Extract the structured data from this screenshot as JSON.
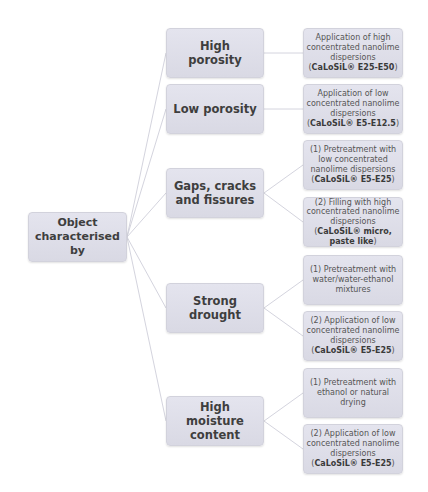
{
  "diagram": {
    "root": {
      "label_line1": "Object",
      "label_line2": "characterised by"
    },
    "colors": {
      "node_fill": "#dcdce6",
      "node_border": "#d2d2dc",
      "connector": "#d4d4de",
      "text": "#3e3e3e"
    },
    "categories": [
      {
        "label": "High porosity",
        "treatments": [
          {
            "text": "Application of high concentrated nanolime dispersions (",
            "product": "CaLoSiL® E25-E50",
            "suffix": ")"
          }
        ]
      },
      {
        "label": "Low porosity",
        "treatments": [
          {
            "text": "Application of low concentrated nanolime dispersions (",
            "product": "CaLoSiL® E5-E12.5",
            "suffix": ")"
          }
        ]
      },
      {
        "label": "Gaps, cracks and fissures",
        "treatments": [
          {
            "text": "(1) Pretreatment with low concentrated nanolime dispersions (",
            "product": "CaLoSiL® E5-E25",
            "suffix": ")"
          },
          {
            "text": "(2) Filling with high concentrated nanolime dispersions (",
            "product": "CaLoSiL® micro, paste like",
            "suffix": ")"
          }
        ]
      },
      {
        "label": "Strong drought",
        "treatments": [
          {
            "text": "(1) Pretreatment with water/water-ethanol mixtures",
            "product": "",
            "suffix": ""
          },
          {
            "text": "(2) Application of low concentrated nanolime dispersions (",
            "product": "CaLoSiL® E5-E25",
            "suffix": ")"
          }
        ]
      },
      {
        "label": "High moisture content",
        "treatments": [
          {
            "text": "(1) Pretreatment with ethanol or natural drying",
            "product": "",
            "suffix": ""
          },
          {
            "text": "(2) Application of low concentrated nanolime dispersions (",
            "product": "CaLoSiL® E5-E25",
            "suffix": ")"
          }
        ]
      }
    ]
  }
}
